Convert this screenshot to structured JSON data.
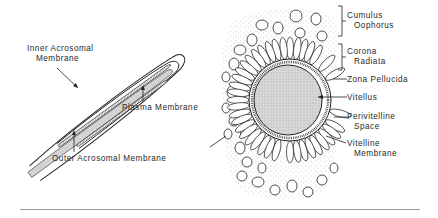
{
  "sperm_labels": {
    "inner_acrosomal": [
      "Inner Acrosomal",
      "Membrane"
    ],
    "plasma": "Plasma Membrane",
    "outer_acrosomal": "Outer Acrosomal Membrane"
  },
  "egg_labels": {
    "cumulus": [
      "Cumulus",
      "Oophorus"
    ],
    "corona": [
      "Corona",
      "Radiata"
    ],
    "zona": "Zona Pellucida",
    "vitellus": "Vitellus",
    "perivitelline": [
      "Perivitelline",
      "Space"
    ],
    "vitelline": [
      "Vitelline",
      "Membrane"
    ]
  },
  "colors": {
    "ink": "#2a2a2a",
    "stipple": "#bdbdbd",
    "rule": "#9a9a9a"
  }
}
